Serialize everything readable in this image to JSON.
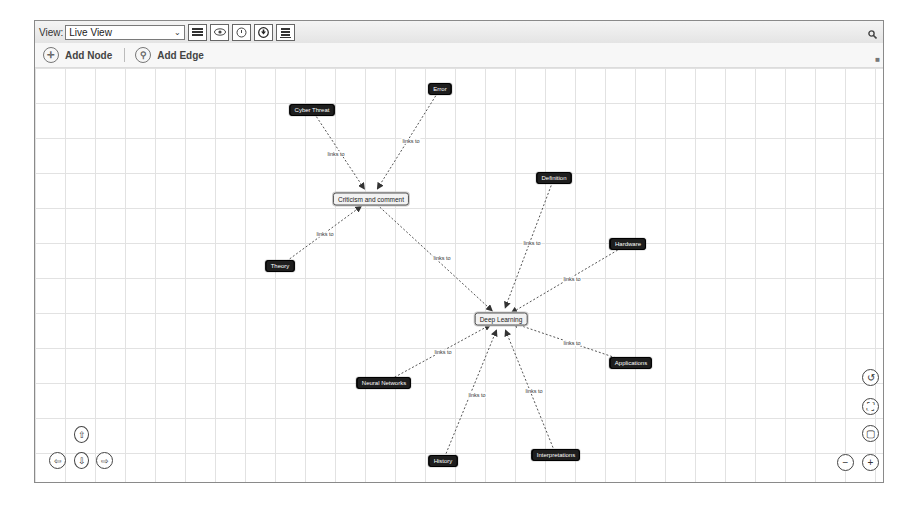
{
  "toolbar": {
    "view_label": "View:",
    "view_selected": "Live View",
    "buttons": [
      {
        "name": "list-icon"
      },
      {
        "name": "eye-icon"
      },
      {
        "name": "timer-icon"
      },
      {
        "name": "download-icon"
      },
      {
        "name": "stack-icon"
      }
    ]
  },
  "actions": {
    "add_node": "Add Node",
    "add_edge": "Add Edge"
  },
  "graph": {
    "nodes": [
      {
        "id": "error",
        "label": "Error",
        "x": 405,
        "y": 21
      },
      {
        "id": "cyber",
        "label": "Cyber Threat",
        "x": 277,
        "y": 42
      },
      {
        "id": "crit",
        "label": "Criticism and comment",
        "x": 336,
        "y": 131,
        "hub": true
      },
      {
        "id": "definition",
        "label": "Definition",
        "x": 519,
        "y": 110
      },
      {
        "id": "hardware",
        "label": "Hardware",
        "x": 593,
        "y": 176
      },
      {
        "id": "theory",
        "label": "Theory",
        "x": 245,
        "y": 198
      },
      {
        "id": "deep",
        "label": "Deep Learning",
        "x": 466,
        "y": 251,
        "hub": true
      },
      {
        "id": "applications",
        "label": "Applications",
        "x": 596,
        "y": 295
      },
      {
        "id": "neural",
        "label": "Neural Networks",
        "x": 349,
        "y": 315
      },
      {
        "id": "history",
        "label": "History",
        "x": 408,
        "y": 393
      },
      {
        "id": "interp",
        "label": "Interpretations",
        "x": 521,
        "y": 387
      }
    ],
    "edges": [
      {
        "from": "cyber",
        "to": "crit",
        "label": "links to",
        "lx": 301,
        "ly": 86
      },
      {
        "from": "error",
        "to": "crit",
        "label": "links to",
        "lx": 376,
        "ly": 73
      },
      {
        "from": "theory",
        "to": "crit",
        "label": "links to",
        "lx": 290,
        "ly": 166
      },
      {
        "from": "crit",
        "to": "deep",
        "label": "links to",
        "lx": 407,
        "ly": 190
      },
      {
        "from": "definition",
        "to": "deep",
        "label": "links to",
        "lx": 497,
        "ly": 175
      },
      {
        "from": "hardware",
        "to": "deep",
        "label": "links to",
        "lx": 537,
        "ly": 211
      },
      {
        "from": "applications",
        "to": "deep",
        "label": "links to",
        "lx": 537,
        "ly": 275
      },
      {
        "from": "neural",
        "to": "deep",
        "label": "links to",
        "lx": 408,
        "ly": 284
      },
      {
        "from": "history",
        "to": "deep",
        "label": "links to",
        "lx": 442,
        "ly": 327
      },
      {
        "from": "interp",
        "to": "deep",
        "label": "links to",
        "lx": 499,
        "ly": 323
      }
    ]
  },
  "navigation": {
    "up": "⇧",
    "left": "⇦",
    "down": "⇩",
    "right": "⇨"
  },
  "zoom_controls": {
    "fit": "↺",
    "expand": "⛶",
    "reset": "▢",
    "zoom_out": "−",
    "zoom_in": "+"
  },
  "colors": {
    "node_bg": "#1e1e1e",
    "hub_bg": "#f2f2f2",
    "edge": "#555555",
    "grid": "#e2e2e2"
  }
}
